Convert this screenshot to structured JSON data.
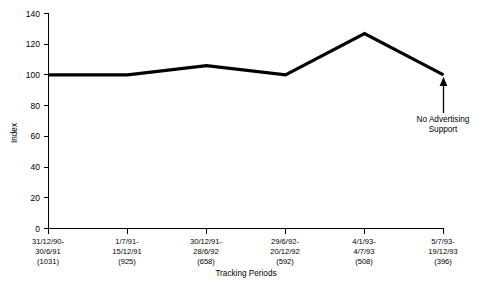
{
  "chart_data": {
    "type": "line",
    "title": "",
    "xlabel": "Tracking Periods",
    "ylabel": "Index",
    "ylim": [
      0,
      140
    ],
    "yticks": [
      0,
      20,
      40,
      60,
      80,
      100,
      120,
      140
    ],
    "ytick_labels": [
      "0",
      "20",
      "40",
      "60",
      "80",
      "100",
      "120",
      "140"
    ],
    "grid": false,
    "legend": "none",
    "categories": [
      "31/12/90-\n30/6/91\n(1031)",
      "1/7/91-\n15/12/91\n(925)",
      "30/12/91-\n28/6/92\n(658)",
      "29/6/92-\n20/12/92\n(592)",
      "4/1/93-\n4/7/93\n(508)",
      "5/7/93-\n19/12/93\n(396)"
    ],
    "xtick_labels": [
      {
        "line1": "31/12/90-",
        "line2": "30/6/91",
        "line3": "(1031)"
      },
      {
        "line1": "1/7/91-",
        "line2": "15/12/91",
        "line3": "(925)"
      },
      {
        "line1": "30/12/91-",
        "line2": "28/6/92",
        "line3": "(658)"
      },
      {
        "line1": "29/6/92-",
        "line2": "20/12/92",
        "line3": "(592)"
      },
      {
        "line1": "4/1/93-",
        "line2": "4/7/93",
        "line3": "(508)"
      },
      {
        "line1": "5/7/93-",
        "line2": "19/12/93",
        "line3": "(396)"
      }
    ],
    "sample_sizes": [
      1031,
      925,
      658,
      592,
      508,
      396
    ],
    "values": [
      100,
      100,
      106,
      100,
      127,
      100
    ],
    "series": [
      {
        "name": "Index",
        "values": [
          100,
          100,
          106,
          100,
          127,
          100
        ]
      }
    ],
    "annotations": [
      {
        "name": "no-advertising-support",
        "line1": "No Advertising",
        "line2": "Support",
        "points_to_category_index": 5,
        "points_to_value": 100
      }
    ],
    "colors": {
      "line": "#000000",
      "axis": "#000000",
      "background": "#ffffff"
    }
  }
}
